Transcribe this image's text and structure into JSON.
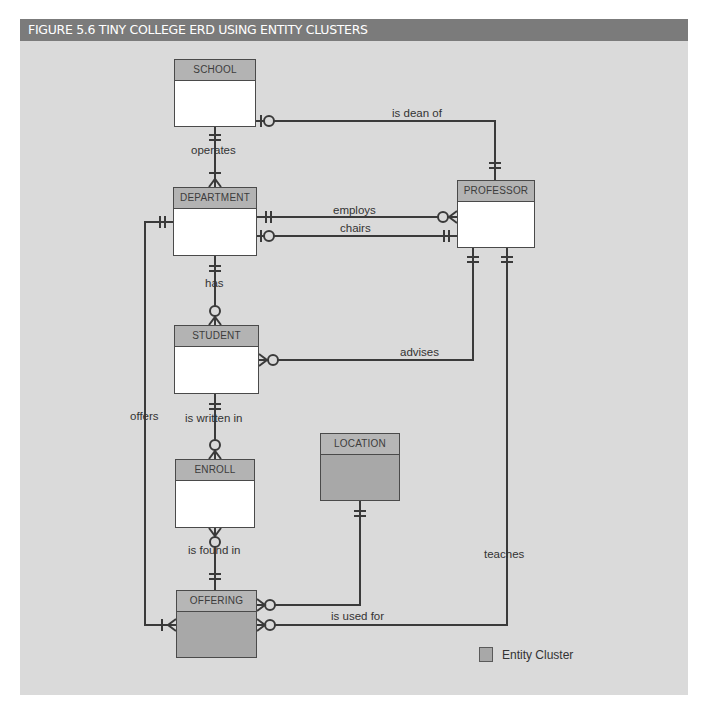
{
  "figure": {
    "title": "FIGURE 5.6  TINY COLLEGE ERD USING ENTITY CLUSTERS"
  },
  "entities": {
    "school": {
      "name": "SCHOOL",
      "type": "entity"
    },
    "department": {
      "name": "DEPARTMENT",
      "type": "entity"
    },
    "professor": {
      "name": "PROFESSOR",
      "type": "entity"
    },
    "student": {
      "name": "STUDENT",
      "type": "entity"
    },
    "enroll": {
      "name": "ENROLL",
      "type": "entity"
    },
    "location": {
      "name": "LOCATION",
      "type": "entity-cluster"
    },
    "offering": {
      "name": "OFFERING",
      "type": "entity-cluster"
    }
  },
  "relationships": {
    "is_dean_of": {
      "label": "is dean of",
      "from": "PROFESSOR",
      "to": "SCHOOL",
      "cardinality": "1:0..1"
    },
    "operates": {
      "label": "operates",
      "from": "SCHOOL",
      "to": "DEPARTMENT",
      "cardinality": "1:1..M"
    },
    "employs": {
      "label": "employs",
      "from": "DEPARTMENT",
      "to": "PROFESSOR",
      "cardinality": "1:0..M"
    },
    "chairs": {
      "label": "chairs",
      "from": "PROFESSOR",
      "to": "DEPARTMENT",
      "cardinality": "1:0..1"
    },
    "has": {
      "label": "has",
      "from": "DEPARTMENT",
      "to": "STUDENT",
      "cardinality": "1:0..M"
    },
    "advises": {
      "label": "advises",
      "from": "PROFESSOR",
      "to": "STUDENT",
      "cardinality": "1:0..M"
    },
    "offers": {
      "label": "offers",
      "from": "DEPARTMENT",
      "to": "OFFERING",
      "cardinality": "1:1..M"
    },
    "is_written_in": {
      "label": "is written in",
      "from": "STUDENT",
      "to": "ENROLL",
      "cardinality": "1:0..M"
    },
    "is_found_in": {
      "label": "is found in",
      "from": "OFFERING",
      "to": "ENROLL",
      "cardinality": "1:0..M"
    },
    "is_used_for": {
      "label": "is used for",
      "from": "LOCATION",
      "to": "OFFERING",
      "cardinality": "1:0..M"
    },
    "teaches": {
      "label": "teaches",
      "from": "PROFESSOR",
      "to": "OFFERING",
      "cardinality": "1:0..M"
    }
  },
  "legend": {
    "entity_cluster": "Entity Cluster"
  },
  "colors": {
    "title_bar": "#7b7b7b",
    "background": "#dadada",
    "entity_fill": "#ffffff",
    "cluster_fill": "#a8a8a8",
    "header_fill": "#b3b3b3",
    "line": "#3a3a3a"
  }
}
